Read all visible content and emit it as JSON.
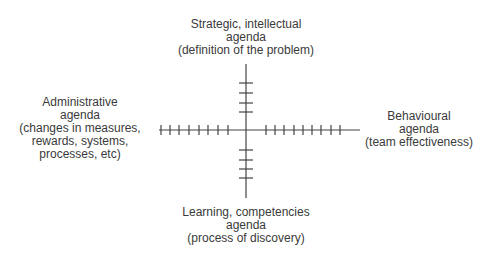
{
  "diagram": {
    "type": "quadrant-axes",
    "axis_color": "#444444",
    "text_color": "#3a3a3a",
    "center": {
      "x": 246,
      "y": 130
    },
    "horizontal_axis": {
      "x_start": 159,
      "x_end": 360,
      "left_ticks": 8,
      "right_ticks": 9
    },
    "vertical_axis": {
      "y_start": 64,
      "y_end": 198,
      "top_ticks": 4,
      "bottom_ticks": 4
    },
    "labels": {
      "top": {
        "lines": [
          "Strategic, intellectual",
          "agenda",
          "(definition of the problem)"
        ]
      },
      "left": {
        "lines": [
          "Administrative",
          "agenda",
          "(changes in measures,",
          "rewards, systems,",
          "processes, etc)"
        ]
      },
      "right": {
        "lines": [
          "Behavioural",
          "agenda",
          "(team effectiveness)"
        ]
      },
      "bottom": {
        "lines": [
          "Learning, competencies",
          "agenda",
          "(process of discovery)"
        ]
      }
    }
  }
}
